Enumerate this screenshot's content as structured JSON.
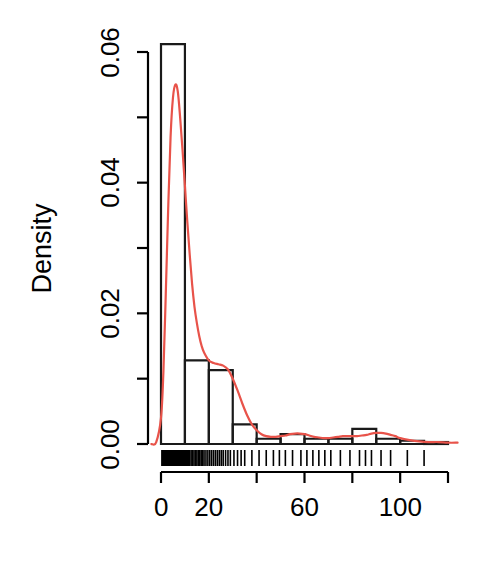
{
  "chart_data": {
    "type": "bar",
    "title": "",
    "subtitle": "",
    "xlabel": "",
    "ylabel": "Density",
    "xlim": [
      -4,
      124
    ],
    "ylim": [
      0,
      0.0625
    ],
    "grid": false,
    "legend": null,
    "bin_width": 10,
    "categories": [
      "0-10",
      "10-20",
      "20-30",
      "30-40",
      "40-50",
      "50-60",
      "60-70",
      "70-80",
      "80-90",
      "90-100",
      "100-110",
      "110-120"
    ],
    "bin_edges": [
      0,
      10,
      20,
      30,
      40,
      50,
      60,
      70,
      80,
      90,
      100,
      110,
      120
    ],
    "values": [
      0.0612,
      0.0128,
      0.0113,
      0.003,
      0.0008,
      0.0015,
      0.0008,
      0.0008,
      0.0023,
      0.0008,
      0.0005,
      0.0003
    ],
    "series": [
      {
        "name": "Histogram",
        "type": "bar",
        "color": "#000000",
        "values": [
          0.0612,
          0.0128,
          0.0113,
          0.003,
          0.0008,
          0.0015,
          0.0008,
          0.0008,
          0.0023,
          0.0008,
          0.0005,
          0.0003
        ]
      },
      {
        "name": "Density curve",
        "type": "line",
        "color": "#E8534A",
        "x": [
          -4,
          -2,
          0,
          1,
          2,
          3,
          4,
          5,
          6,
          7,
          8,
          9,
          10,
          11,
          12,
          13,
          14,
          15,
          16,
          17,
          18,
          20,
          22,
          24,
          26,
          28,
          30,
          32,
          34,
          36,
          38,
          40,
          42,
          44,
          46,
          48,
          50,
          52,
          54,
          56,
          58,
          60,
          62,
          64,
          66,
          68,
          70,
          72,
          74,
          76,
          78,
          80,
          82,
          84,
          86,
          88,
          90,
          92,
          94,
          96,
          98,
          100,
          104,
          108,
          112,
          116,
          120,
          124
        ],
        "y": [
          0.0,
          0.0003,
          0.004,
          0.011,
          0.023,
          0.036,
          0.047,
          0.053,
          0.055,
          0.054,
          0.05,
          0.045,
          0.0395,
          0.034,
          0.029,
          0.0245,
          0.021,
          0.0185,
          0.0165,
          0.015,
          0.014,
          0.0128,
          0.0124,
          0.0122,
          0.012,
          0.0114,
          0.01,
          0.0082,
          0.0062,
          0.0044,
          0.003,
          0.0021,
          0.0015,
          0.0012,
          0.0011,
          0.0011,
          0.0012,
          0.0013,
          0.0015,
          0.0016,
          0.0016,
          0.0015,
          0.0013,
          0.0011,
          0.001,
          0.0009,
          0.0009,
          0.001,
          0.0011,
          0.0012,
          0.0012,
          0.0012,
          0.0012,
          0.0013,
          0.0014,
          0.0016,
          0.0017,
          0.0017,
          0.0016,
          0.0014,
          0.0012,
          0.0009,
          0.0006,
          0.0004,
          0.0003,
          0.0003,
          0.0002,
          0.0002
        ]
      },
      {
        "name": "Rug",
        "type": "rug",
        "color": "#000000",
        "x": [
          0.4,
          0.6,
          0.8,
          1.0,
          1.1,
          1.3,
          1.5,
          1.6,
          1.8,
          2.0,
          2.1,
          2.3,
          2.5,
          2.6,
          2.8,
          3.0,
          3.1,
          3.3,
          3.5,
          3.7,
          3.9,
          4.0,
          4.2,
          4.4,
          4.6,
          4.8,
          5.0,
          5.2,
          5.4,
          5.6,
          5.8,
          6.0,
          6.3,
          6.6,
          6.9,
          7.2,
          7.5,
          7.8,
          8.1,
          8.4,
          8.7,
          9.0,
          9.4,
          9.8,
          10.2,
          10.6,
          11.0,
          11.5,
          12.0,
          12.6,
          13.2,
          13.8,
          14.4,
          15.0,
          15.6,
          16.2,
          16.8,
          17.4,
          18.0,
          18.8,
          19.6,
          20.4,
          21.2,
          22.0,
          22.8,
          23.6,
          24.4,
          25.2,
          26.0,
          27.0,
          28.0,
          29.0,
          30.5,
          32.0,
          33.5,
          35.0,
          38.0,
          41.0,
          44.0,
          47.0,
          49.5,
          52.0,
          55.0,
          58.5,
          61.0,
          63.5,
          66.0,
          68.5,
          71.0,
          75.0,
          79.0,
          83.0,
          85.5,
          88.0,
          92.0,
          96.0,
          103.0,
          110.0
        ]
      }
    ],
    "x_ticks": [
      {
        "value": 0,
        "label": "0",
        "labeled": true
      },
      {
        "value": 20,
        "label": "20",
        "labeled": true
      },
      {
        "value": 40,
        "label": "",
        "labeled": false
      },
      {
        "value": 60,
        "label": "60",
        "labeled": true
      },
      {
        "value": 80,
        "label": "",
        "labeled": false
      },
      {
        "value": 100,
        "label": "100",
        "labeled": true
      },
      {
        "value": 120,
        "label": "",
        "labeled": false
      }
    ],
    "y_ticks": [
      {
        "value": 0.0,
        "label": "0.00",
        "labeled": true
      },
      {
        "value": 0.01,
        "label": "",
        "labeled": false
      },
      {
        "value": 0.02,
        "label": "0.02",
        "labeled": true
      },
      {
        "value": 0.03,
        "label": "",
        "labeled": false
      },
      {
        "value": 0.04,
        "label": "0.04",
        "labeled": true
      },
      {
        "value": 0.05,
        "label": "",
        "labeled": false
      },
      {
        "value": 0.06,
        "label": "0.06",
        "labeled": true
      }
    ],
    "colors": {
      "axis": "#000000",
      "histogram_border": "#1a1a1a",
      "density_line": "#E8534A",
      "rug": "#000000",
      "background": "#ffffff"
    }
  },
  "axis": {
    "y_title": "Density",
    "y_tick_labels": [
      "0.00",
      "0.02",
      "0.04",
      "0.06"
    ],
    "x_tick_labels": [
      "0",
      "20",
      "60",
      "100"
    ]
  }
}
